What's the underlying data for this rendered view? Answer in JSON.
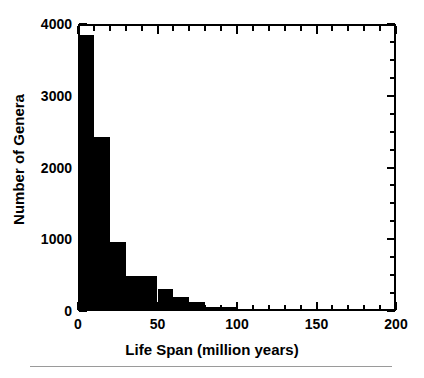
{
  "chart_data": {
    "type": "bar",
    "title": "",
    "subtitle": "",
    "xlabel": "Life Span (million years)",
    "ylabel": "Number of Genera",
    "xlim": [
      0,
      200
    ],
    "ylim": [
      0,
      4000
    ],
    "grid": false,
    "legend": null,
    "bin_width": 10,
    "bar_color": "#000000",
    "axis_color": "#000000",
    "background": "#ffffff",
    "categories": [
      "0-10",
      "10-20",
      "20-30",
      "30-40",
      "40-50",
      "50-60",
      "60-70",
      "70-80",
      "80-90",
      "90-100",
      "100-110",
      "110-120",
      "120-130",
      "130-140",
      "140-150",
      "150-160",
      "160-170",
      "170-180",
      "180-190",
      "190-200"
    ],
    "bin_starts": [
      0,
      10,
      20,
      30,
      40,
      50,
      60,
      70,
      80,
      90,
      100,
      110,
      120,
      130,
      140,
      150,
      160,
      170,
      180,
      190
    ],
    "values": [
      3850,
      2430,
      960,
      490,
      490,
      300,
      190,
      130,
      60,
      55,
      30,
      30,
      0,
      25,
      0,
      0,
      0,
      0,
      0,
      0
    ],
    "xticks_major": [
      0,
      50,
      100,
      150,
      200
    ],
    "xticks_major_labels": [
      "0",
      "50",
      "100",
      "150",
      "200"
    ],
    "xticks_minor": [
      10,
      20,
      30,
      40,
      60,
      70,
      80,
      90,
      110,
      120,
      130,
      140,
      160,
      170,
      180,
      190
    ],
    "yticks_major": [
      0,
      1000,
      2000,
      3000,
      4000
    ],
    "yticks_major_labels": [
      "0",
      "1000",
      "2000",
      "3000",
      "4000"
    ],
    "yticks_minor": [
      250,
      500,
      750,
      1250,
      1500,
      1750,
      2250,
      2500,
      2750,
      3250,
      3500,
      3750
    ]
  }
}
